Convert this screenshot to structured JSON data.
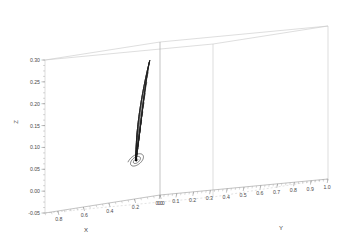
{
  "chart_data": {
    "type": "line",
    "title": "",
    "subtitle": "",
    "projection": "3d",
    "xlabel": "X",
    "ylabel": "Y",
    "zlabel": "Z",
    "xlim": [
      0.0,
      0.9
    ],
    "ylim": [
      0.0,
      1.0
    ],
    "zlim": [
      -0.05,
      0.3
    ],
    "xticks": [
      "0.0",
      "0.2",
      "0.4",
      "0.6",
      "0.8"
    ],
    "xtick_values": [
      0.0,
      0.2,
      0.4,
      0.6,
      0.8
    ],
    "yticks": [
      "0.0",
      "0.1",
      "0.2",
      "0.3",
      "0.4",
      "0.5",
      "0.6",
      "0.7",
      "0.8",
      "0.9",
      "1.0"
    ],
    "ytick_values": [
      0.0,
      0.1,
      0.2,
      0.3,
      0.4,
      0.5,
      0.6,
      0.7,
      0.8,
      0.9,
      1.0
    ],
    "zticks": [
      "-0.05",
      "0.00",
      "0.05",
      "0.10",
      "0.15",
      "0.20",
      "0.25",
      "0.30"
    ],
    "ztick_values": [
      -0.05,
      0.0,
      0.05,
      0.1,
      0.15,
      0.2,
      0.25,
      0.3
    ],
    "grid": false,
    "legend": null,
    "legend_position": "none",
    "annotations": [],
    "series": [
      {
        "name": "trajectory",
        "description": "3D phase-space orbit spiralling inward to a focus",
        "color": "#333333",
        "linewidth": 0.6,
        "n_loops": 14
      }
    ],
    "focus_point": {
      "x": 0.62,
      "y": 0.33,
      "z": 0.045
    },
    "peak_point": {
      "x": 0.22,
      "y": 0.02,
      "z": 0.275
    },
    "background_color": "#ffffff",
    "box_color": "#b4b4b4"
  },
  "axes": {
    "z": {
      "title": "Z",
      "ticks": [
        {
          "label": "0.30",
          "v": 0.3
        },
        {
          "label": "0.25",
          "v": 0.25
        },
        {
          "label": "0.20",
          "v": 0.2
        },
        {
          "label": "0.15",
          "v": 0.15
        },
        {
          "label": "0.10",
          "v": 0.1
        },
        {
          "label": "0.05",
          "v": 0.05
        },
        {
          "label": "0.00",
          "v": 0.0
        },
        {
          "label": "-0.05",
          "v": -0.05
        }
      ]
    },
    "x": {
      "title": "X",
      "ticks": [
        {
          "label": "0.0",
          "v": 0.0
        },
        {
          "label": "0.2",
          "v": 0.2
        },
        {
          "label": "0.4",
          "v": 0.4
        },
        {
          "label": "0.6",
          "v": 0.6
        },
        {
          "label": "0.8",
          "v": 0.8
        }
      ]
    },
    "y": {
      "title": "Y",
      "ticks": [
        {
          "label": "0.0",
          "v": 0.0
        },
        {
          "label": "0.1",
          "v": 0.1
        },
        {
          "label": "0.2",
          "v": 0.2
        },
        {
          "label": "0.3",
          "v": 0.3
        },
        {
          "label": "0.4",
          "v": 0.4
        },
        {
          "label": "0.5",
          "v": 0.5
        },
        {
          "label": "0.6",
          "v": 0.6
        },
        {
          "label": "0.7",
          "v": 0.7
        },
        {
          "label": "0.8",
          "v": 0.8
        },
        {
          "label": "0.9",
          "v": 0.9
        },
        {
          "label": "1.0",
          "v": 1.0
        }
      ]
    }
  },
  "geometry": {
    "origin": {
      "x": 160.0,
      "y": 195.0
    },
    "ex": {
      "x": -115.0,
      "y": 18.0
    },
    "ey": {
      "x": 168.0,
      "y": -16.0
    },
    "ez": {
      "x": 0.0,
      "y": -430.0
    },
    "zmin": -0.05,
    "zmax": 0.3
  }
}
